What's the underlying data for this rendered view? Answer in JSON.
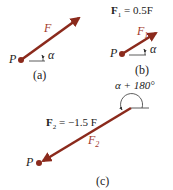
{
  "colors": {
    "vector": "#8b2a1c",
    "point": "#8b2a1c",
    "text": "#222222",
    "vector_label": "#a33a2c"
  },
  "panels": [
    {
      "id": "a",
      "caption": "(a)",
      "point_label": "P",
      "vector_label": "F",
      "angle_label": "α"
    },
    {
      "id": "b",
      "caption": "(b)",
      "point_label": "P",
      "vector_label": "F",
      "vector_subscript": "1",
      "angle_label": "α",
      "equation": {
        "lhs": "F",
        "lhs_sub": "1",
        "rhs": "= 0.5F"
      }
    },
    {
      "id": "c",
      "caption": "(c)",
      "point_label": "P",
      "vector_label": "F",
      "vector_subscript": "2",
      "angle_label": "α + 180°",
      "equation": {
        "lhs": "F",
        "lhs_sub": "2",
        "rhs": "= −1.5 F"
      }
    }
  ]
}
